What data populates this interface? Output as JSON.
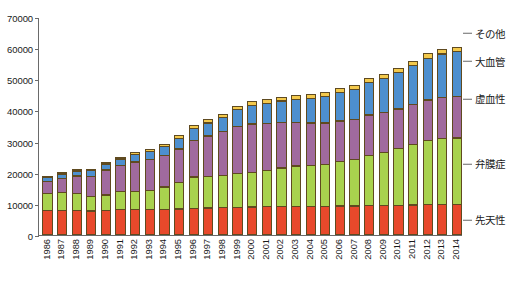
{
  "chart_data": {
    "type": "bar",
    "subtype": "stacked-bar",
    "title": "",
    "xlabel": "",
    "ylabel": "",
    "ylim": [
      0,
      70000
    ],
    "ytick_step": 10000,
    "yticks": [
      "0",
      "10000",
      "20000",
      "30000",
      "40000",
      "50000",
      "60000",
      "70000"
    ],
    "grid": false,
    "legend_position": "right",
    "categories": [
      "1986",
      "1987",
      "1988",
      "1989",
      "1990",
      "1991",
      "1992",
      "1993",
      "1994",
      "1995",
      "1996",
      "1997",
      "1998",
      "1999",
      "2000",
      "2001",
      "2002",
      "2003",
      "2004",
      "2005",
      "2006",
      "2007",
      "2008",
      "2009",
      "2010",
      "2011",
      "2012",
      "2013",
      "2014"
    ],
    "series": [
      {
        "name": "先天性",
        "color": "#E8492B",
        "values": [
          7900,
          8000,
          8000,
          7800,
          7900,
          8200,
          8300,
          8300,
          8400,
          8500,
          8700,
          8800,
          8900,
          9000,
          9100,
          9200,
          9300,
          9300,
          9300,
          9300,
          9400,
          9400,
          9500,
          9500,
          9600,
          9700,
          9800,
          9900,
          10000
        ]
      },
      {
        "name": "弁膜症",
        "color": "#A9D24E",
        "values": [
          5700,
          6000,
          5600,
          4800,
          5300,
          6000,
          6000,
          6400,
          7400,
          8800,
          10300,
          10400,
          10500,
          11100,
          11300,
          11900,
          12600,
          13200,
          13400,
          13700,
          14500,
          15100,
          16400,
          17300,
          18500,
          19700,
          20800,
          21400,
          21500
        ]
      },
      {
        "name": "虚血性",
        "color": "#A06A9E",
        "values": [
          4100,
          4800,
          5900,
          6800,
          8200,
          8600,
          9700,
          10000,
          10200,
          10900,
          11900,
          13200,
          14400,
          15400,
          15800,
          15200,
          14700,
          14200,
          13800,
          13500,
          13300,
          13100,
          13200,
          13000,
          12900,
          13100,
          13300,
          13400,
          13500
        ]
      },
      {
        "name": "大血管",
        "color": "#4D8FCF",
        "values": [
          1600,
          1600,
          1800,
          2000,
          2200,
          2400,
          2600,
          2900,
          3100,
          3600,
          4000,
          4400,
          4800,
          5500,
          6100,
          6700,
          7200,
          7600,
          8100,
          8700,
          9300,
          9900,
          10600,
          11300,
          11900,
          12700,
          13600,
          14200,
          14600
        ]
      },
      {
        "name": "その他",
        "color": "#F3C94C",
        "values": [
          300,
          300,
          300,
          400,
          800,
          800,
          900,
          900,
          1000,
          1100,
          1200,
          1200,
          1300,
          1400,
          1500,
          1500,
          1500,
          1500,
          1500,
          1500,
          1600,
          1600,
          1600,
          1600,
          1600,
          1700,
          1700,
          1700,
          1700
        ]
      }
    ],
    "legend_entries": [
      {
        "label": "その他",
        "color": "#F3C94C",
        "value_at_right_axis": 65000
      },
      {
        "label": "大血管",
        "color": "#4D8FCF",
        "value_at_right_axis": 56000
      },
      {
        "label": "虚血性",
        "color": "#A06A9E",
        "value_at_right_axis": 44000
      },
      {
        "label": "弁膜症",
        "color": "#A9D24E",
        "value_at_right_axis": 23000
      },
      {
        "label": "先天性",
        "color": "#E8492B",
        "value_at_right_axis": 5000
      }
    ],
    "totals": [
      19600,
      20700,
      21600,
      21800,
      24400,
      26000,
      27500,
      28500,
      30100,
      32900,
      36100,
      39000,
      41900,
      44400,
      45800,
      46500,
      47300,
      47800,
      48100,
      48700,
      50100,
      51100,
      53300,
      54700,
      56500,
      58900,
      61200,
      62600,
      63300
    ]
  },
  "axis": {
    "tick_color": "#6a6a6a"
  }
}
